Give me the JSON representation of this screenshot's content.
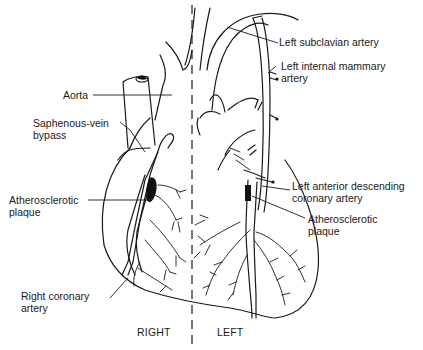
{
  "diagram": {
    "labels": {
      "left_subclavian": "Left subclavian artery",
      "lima_line1": "Left internal mammary",
      "lima_line2": "artery",
      "aorta": "Aorta",
      "saphenous_line1": "Saphenous-vein",
      "saphenous_line2": "bypass",
      "plaque_right_line1": "Atherosclerotic",
      "plaque_right_line2": "plaque",
      "lad_line1": "Left anterior descending",
      "lad_line2": "coronary artery",
      "plaque_left_line1": "Atherosclerotic",
      "plaque_left_line2": "plaque",
      "rca_line1": "Right coronary",
      "rca_line2": "artery"
    },
    "sides": {
      "right": "RIGHT",
      "left": "LEFT"
    },
    "colors": {
      "ink": "#1a1a1a",
      "background": "#ffffff",
      "plaque": "#111111"
    }
  }
}
